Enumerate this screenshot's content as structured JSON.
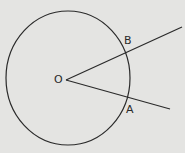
{
  "diagram": {
    "colors": {
      "background": "#e4e4e2",
      "stroke": "#2a2a2a"
    },
    "labels": {
      "center": "O",
      "point_a": "A",
      "point_b": "B"
    }
  }
}
